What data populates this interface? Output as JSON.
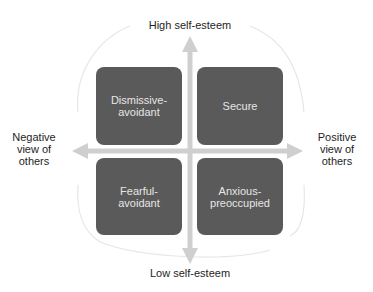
{
  "diagram": {
    "type": "quadrant",
    "axes": {
      "top": "High self-esteem",
      "bottom": "Low self-esteem",
      "left": [
        "Negative",
        "view of",
        "others"
      ],
      "right": [
        "Positive",
        "view of",
        "others"
      ]
    },
    "quadrants": {
      "top_left": [
        "Dismissive-",
        "avoidant"
      ],
      "top_right": [
        "Secure"
      ],
      "bottom_left": [
        "Fearful-",
        "avoidant"
      ],
      "bottom_right": [
        "Anxious-",
        "preoccupied"
      ]
    },
    "colors": {
      "box_fill": "#5a5a5a",
      "box_text": "#e6e6e6",
      "arrow": "#cfcfcf",
      "outline": "#e4e4e4",
      "label_text": "#1e1e1e"
    }
  }
}
